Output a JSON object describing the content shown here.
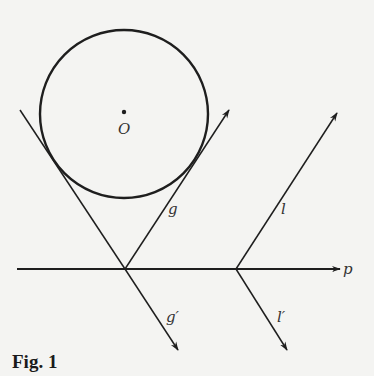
{
  "figure": {
    "caption": "Fig. 1",
    "center_label": "O",
    "line_labels": {
      "p": "p",
      "g": "g",
      "g_prime": "g′",
      "l": "l",
      "l_prime": "l′"
    }
  },
  "colors": {
    "background": "#f4f4f2",
    "stroke": "#1e1e1e",
    "label": "#333333"
  }
}
